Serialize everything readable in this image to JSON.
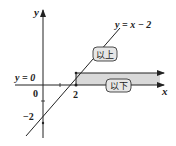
{
  "diagram": {
    "axes": {
      "x_label": "x",
      "y_label": "y",
      "origin_label": "0"
    },
    "ticks": {
      "x_two": "2",
      "y_minus_two": "−2"
    },
    "lines": {
      "boundary_label": "y = 0",
      "function_label": "y = x − 2"
    },
    "tags": {
      "above": "以上",
      "below": "以下"
    },
    "colors": {
      "stroke": "#222222",
      "shade": "#d9d9d9",
      "tag_fill": "#e6e6e6"
    }
  }
}
